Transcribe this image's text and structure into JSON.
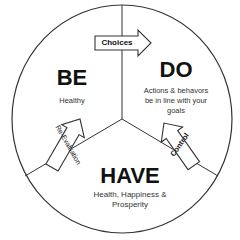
{
  "diagram": {
    "sections": [
      {
        "title": "BE",
        "description": "Healthy"
      },
      {
        "title": "DO",
        "description_lines": [
          "Actions & behavors",
          "be in line with your",
          "goals"
        ]
      },
      {
        "title": "HAVE",
        "description_lines": [
          "Health, Happiness &",
          "Prosperity"
        ]
      }
    ],
    "arrows": [
      {
        "label": "Choices",
        "from": "BE",
        "to": "DO"
      },
      {
        "label": "Control",
        "from": "DO",
        "to": "HAVE"
      },
      {
        "label": "Re-Evaluation",
        "from": "HAVE",
        "to": "BE"
      }
    ],
    "colors": {
      "stroke": "#333333",
      "text": "#111111",
      "background": "#ffffff"
    }
  }
}
